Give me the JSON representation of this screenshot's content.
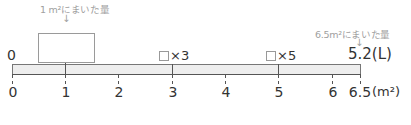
{
  "annotations": {
    "one_m2_caption": "1 m²にまいた量",
    "six_five_m2_caption": "6.5m²にまいた量",
    "down_arrow": "↓"
  },
  "top_labels": {
    "left_zero": "0",
    "times3": "×3",
    "times5": "×5",
    "right_value": "5.2(L)"
  },
  "axis": {
    "unit": "(m²)",
    "ticks": [
      {
        "value": "0",
        "x": 13
      },
      {
        "value": "1",
        "x": 66
      },
      {
        "value": "2",
        "x": 119
      },
      {
        "value": "3",
        "x": 173
      },
      {
        "value": "4",
        "x": 226
      },
      {
        "value": "5",
        "x": 279
      },
      {
        "value": "6",
        "x": 333
      },
      {
        "value": "6.5",
        "x": 360
      }
    ]
  },
  "colors": {
    "bar_fill": "#eeeeee",
    "line": "#555555",
    "caption": "#a0a0a0"
  }
}
